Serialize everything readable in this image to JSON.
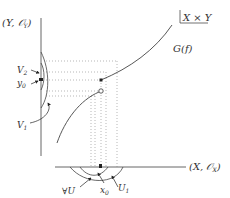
{
  "diagram": {
    "labels": {
      "y_space": "(Y, 𝒪",
      "y_space_sub": "Y",
      "y_space_close": ")",
      "x_space": "(X, 𝒪",
      "x_space_sub": "X",
      "x_space_close": ")",
      "product": "X × Y",
      "graph": "G(f)",
      "V2": "V",
      "V2_sub": "2",
      "y0": "y",
      "y0_sub": "0",
      "V1": "V",
      "V1_sub": "1",
      "forallU": "∀U",
      "x0": "x",
      "x0_sub": "0",
      "U1": "U",
      "U1_sub": "1"
    },
    "colors": {
      "axis": "#555555",
      "curve": "#444444",
      "dotted": "#888888",
      "text": "#333333"
    }
  }
}
